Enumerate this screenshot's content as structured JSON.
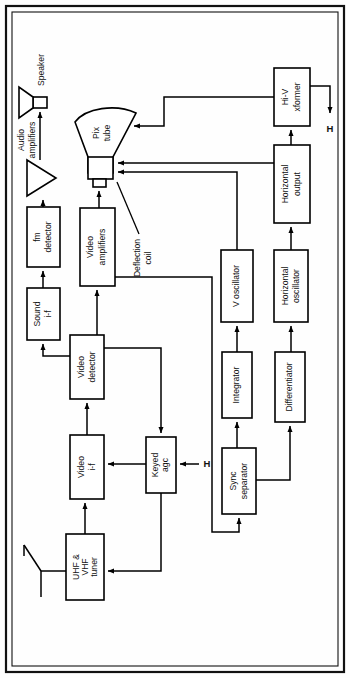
{
  "diagram": {
    "orientation": "rotated-90-ccw",
    "frame": {
      "outer": true,
      "inner": true
    },
    "blocks": [
      {
        "id": "uhf_vhf_tuner",
        "label": "UHF &\nVHF\ntuner",
        "lines": [
          "UHF &",
          "VHF",
          "tuner"
        ]
      },
      {
        "id": "video_if",
        "label": "Video\ni-f",
        "lines": [
          "Video",
          "i-f"
        ]
      },
      {
        "id": "video_detector",
        "label": "Video\ndetector",
        "lines": [
          "Video",
          "detector"
        ]
      },
      {
        "id": "keyed_agc",
        "label": "Keyed\nagc",
        "lines": [
          "Keyed",
          "agc"
        ]
      },
      {
        "id": "sound_if",
        "label": "Sound\ni-f",
        "lines": [
          "Sound",
          "i-f"
        ]
      },
      {
        "id": "fm_detector",
        "label": "fm\ndetector",
        "lines": [
          "fm",
          "detector"
        ]
      },
      {
        "id": "video_amplifiers",
        "label": "Video\namplifiers",
        "lines": [
          "Video",
          "amplifiers"
        ]
      },
      {
        "id": "sync_separator",
        "label": "Sync\nseparator",
        "lines": [
          "Sync",
          "separator"
        ]
      },
      {
        "id": "integrator",
        "label": "Integrator",
        "lines": [
          "Integrator"
        ]
      },
      {
        "id": "differentiator",
        "label": "Differentiator",
        "lines": [
          "Differentiator"
        ]
      },
      {
        "id": "v_oscillator",
        "label": "V oscillator",
        "lines": [
          "V oscillator"
        ]
      },
      {
        "id": "horizontal_oscillator",
        "label": "Horizontal\noscillator",
        "lines": [
          "Horizontal",
          "oscillator"
        ]
      },
      {
        "id": "horizontal_output",
        "label": "Horizontal\noutput",
        "lines": [
          "Horizontal",
          "output"
        ]
      },
      {
        "id": "hi_v_xformer",
        "label": "Hi-V\nxformer",
        "lines": [
          "Hi-V",
          "xformer"
        ]
      }
    ],
    "symbols": [
      {
        "id": "antenna",
        "label": "",
        "kind": "dipole-antenna"
      },
      {
        "id": "audio_amplifiers",
        "label": "Audio\namplifiers",
        "lines": [
          "Audio",
          "amplifiers"
        ],
        "kind": "triangle-amplifier"
      },
      {
        "id": "speaker",
        "label": "Speaker",
        "lines": [
          "Speaker"
        ],
        "kind": "speaker"
      },
      {
        "id": "pix_tube",
        "label": "Pix\ntube",
        "lines": [
          "Pix",
          "tube"
        ],
        "kind": "crt"
      },
      {
        "id": "deflection_coil",
        "label": "Deflection\ncoil",
        "lines": [
          "Deflection",
          "coil"
        ],
        "kind": "yoke-callout"
      }
    ],
    "signal_markers": [
      {
        "id": "h_input_keyed_agc",
        "label": "H",
        "role": "horizontal pulse input to Keyed agc"
      },
      {
        "id": "h_output_hi_v",
        "label": "H",
        "role": "horizontal output from Hi-V xformer"
      }
    ],
    "colors": {
      "ink": "#111111",
      "paper": "#ffffff",
      "block_fill": "#ffffff"
    }
  }
}
